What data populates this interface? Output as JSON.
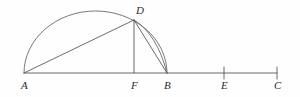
{
  "figure": {
    "background_color": "#fefefe",
    "stroke_color": "#5a5a5a",
    "label_color": "#2b2b2b",
    "points": [
      {
        "id": "A",
        "label": "A",
        "x": 24,
        "y": 73,
        "label_x": 21,
        "label_y": 89,
        "tick": false
      },
      {
        "id": "F",
        "label": "F",
        "x": 134,
        "y": 73,
        "label_x": 131,
        "label_y": 89,
        "tick": false
      },
      {
        "id": "B",
        "label": "B",
        "x": 167,
        "y": 73,
        "label_x": 164,
        "label_y": 89,
        "tick": false
      },
      {
        "id": "E",
        "label": "E",
        "x": 224,
        "y": 73,
        "label_x": 221,
        "label_y": 89,
        "tick": true
      },
      {
        "id": "C",
        "label": "C",
        "x": 277,
        "y": 73,
        "label_x": 274,
        "label_y": 89,
        "tick": true
      },
      {
        "id": "D",
        "label": "D",
        "x": 134,
        "y": 20,
        "label_x": 136,
        "label_y": 14,
        "tick": false
      }
    ],
    "baseline": {
      "x1": 24,
      "y1": 73,
      "x2": 277,
      "y2": 73
    },
    "segments": [
      {
        "name": "segment-AD",
        "from": "A",
        "to": "D",
        "x1": 24,
        "y1": 73,
        "x2": 134,
        "y2": 20
      },
      {
        "name": "segment-DF",
        "from": "D",
        "to": "F",
        "x1": 134,
        "y1": 20,
        "x2": 134,
        "y2": 73
      },
      {
        "name": "segment-DB",
        "from": "D",
        "to": "B",
        "x1": 134,
        "y1": 20,
        "x2": 167,
        "y2": 73
      }
    ],
    "arcs": [
      {
        "name": "semicircle-AB",
        "from": "A",
        "to": "B",
        "path": "M 24 73 A 71.5 62 0 0 1 167 73",
        "center_x": 95.5,
        "apex_y": 11
      },
      {
        "name": "arc-DB",
        "from": "D",
        "to": "B",
        "path": "M 134 20 Q 157 34 167 73"
      }
    ],
    "ticks": [
      {
        "name": "tick-E",
        "x": 224,
        "y1": 67,
        "y2": 79
      },
      {
        "name": "tick-C",
        "x": 277,
        "y1": 67,
        "y2": 79
      }
    ]
  }
}
